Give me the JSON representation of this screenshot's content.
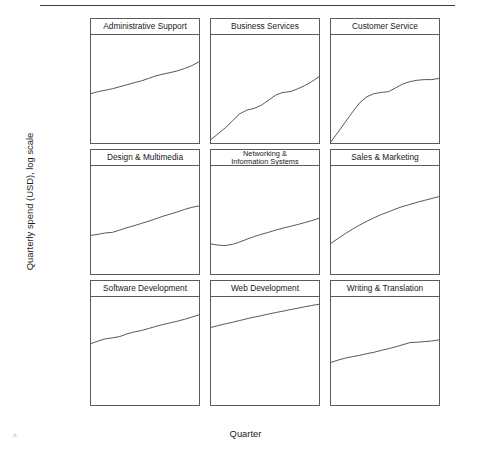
{
  "figure": {
    "y_axis_title": "Quarterly spend (USD), log scale",
    "x_axis_title": "Quarter",
    "artifact_mark": "✶"
  },
  "chart_data": {
    "type": "line",
    "title": "",
    "subtitle": "",
    "xlabel": "Quarter",
    "ylabel": "Quarterly spend (USD), log scale",
    "y_scale": "log10",
    "ylim": [
      20000,
      60000000
    ],
    "xlim": [
      2009.0,
      2012.75
    ],
    "grid": false,
    "legend_position": "none",
    "facet_layout": {
      "rows": 3,
      "cols": 3
    },
    "y_ticks": [
      {
        "value": 100000,
        "label": "$100,000"
      },
      {
        "value": 1000000,
        "label": "$1,000,000"
      },
      {
        "value": 10000000,
        "label": "$10,000,000"
      }
    ],
    "x_ticks": [
      {
        "value": 2009,
        "label": "2009"
      },
      {
        "value": 2010,
        "label": "2010"
      },
      {
        "value": 2011,
        "label": "2011"
      },
      {
        "value": 2012,
        "label": "2012"
      }
    ],
    "x": [
      2009.0,
      2009.25,
      2009.5,
      2009.75,
      2010.0,
      2010.25,
      2010.5,
      2010.75,
      2011.0,
      2011.25,
      2011.5,
      2011.75,
      2012.0,
      2012.25,
      2012.5,
      2012.75
    ],
    "series": [
      {
        "name": "Administrative Support",
        "row": 0,
        "col": 0,
        "values": [
          780000,
          900000,
          1000000,
          1120000,
          1300000,
          1500000,
          1750000,
          2000000,
          2400000,
          2900000,
          3300000,
          3700000,
          4200000,
          5000000,
          6200000,
          8200000
        ]
      },
      {
        "name": "Business Services",
        "row": 0,
        "col": 1,
        "values": [
          26000,
          40000,
          62000,
          105000,
          175000,
          230000,
          260000,
          330000,
          480000,
          700000,
          850000,
          900000,
          1100000,
          1400000,
          1900000,
          2700000
        ]
      },
      {
        "name": "Customer Service",
        "row": 0,
        "col": 2,
        "values": [
          22000,
          45000,
          95000,
          200000,
          400000,
          620000,
          780000,
          850000,
          900000,
          1200000,
          1600000,
          1900000,
          2100000,
          2200000,
          2200000,
          2400000
        ]
      },
      {
        "name": "Design & Multimedia",
        "row": 1,
        "col": 0,
        "values": [
          350000,
          380000,
          420000,
          440000,
          520000,
          620000,
          720000,
          850000,
          1000000,
          1200000,
          1450000,
          1700000,
          2000000,
          2400000,
          2800000,
          3100000
        ]
      },
      {
        "name": "Networking & Information Systems",
        "row": 1,
        "col": 1,
        "values": [
          185000,
          170000,
          165000,
          180000,
          215000,
          265000,
          320000,
          380000,
          440000,
          520000,
          600000,
          680000,
          780000,
          900000,
          1050000,
          1250000
        ]
      },
      {
        "name": "Sales & Marketing",
        "row": 1,
        "col": 2,
        "values": [
          195000,
          280000,
          400000,
          560000,
          760000,
          1000000,
          1300000,
          1650000,
          2000000,
          2500000,
          3000000,
          3500000,
          4100000,
          4700000,
          5400000,
          6200000
        ]
      },
      {
        "name": "Software Development",
        "row": 2,
        "col": 0,
        "values": [
          1900000,
          2300000,
          2700000,
          2900000,
          3200000,
          3900000,
          4500000,
          5000000,
          5800000,
          6800000,
          7800000,
          8800000,
          10000000,
          11500000,
          13500000,
          16000000
        ]
      },
      {
        "name": "Web Development",
        "row": 2,
        "col": 1,
        "values": [
          6300000,
          7200000,
          8200000,
          9200000,
          10500000,
          12000000,
          13500000,
          15000000,
          17000000,
          19000000,
          21000000,
          23500000,
          26000000,
          29000000,
          32000000,
          35000000
        ]
      },
      {
        "name": "Writing & Translation",
        "row": 2,
        "col": 2,
        "values": [
          470000,
          560000,
          650000,
          720000,
          800000,
          900000,
          1000000,
          1150000,
          1300000,
          1500000,
          1750000,
          2050000,
          2100000,
          2200000,
          2300000,
          2500000
        ]
      }
    ]
  }
}
